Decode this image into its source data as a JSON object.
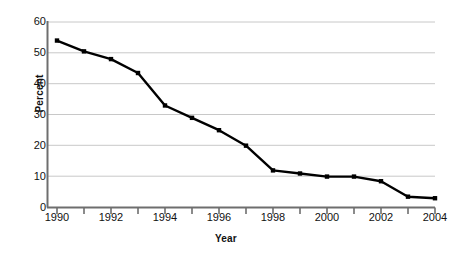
{
  "chart_data": {
    "type": "line",
    "title": "",
    "xlabel": "Year",
    "ylabel": "Percent",
    "xlim": [
      1990,
      2004
    ],
    "ylim": [
      0,
      60
    ],
    "grid": true,
    "legend": null,
    "ytick_labels": [
      "60",
      "50",
      "40",
      "30",
      "20",
      "10",
      "0"
    ],
    "yticks": [
      60,
      50,
      40,
      30,
      20,
      10,
      0
    ],
    "xtick_labels": [
      "1990",
      "1992",
      "1994",
      "1996",
      "1998",
      "2000",
      "2002",
      "2004"
    ],
    "xticks": [
      1990,
      1992,
      1994,
      1996,
      1998,
      2000,
      2002,
      2004
    ],
    "minor_xticks": [
      1991,
      1993,
      1995,
      1997,
      1999,
      2001,
      2003
    ],
    "x": [
      1990,
      1991,
      1992,
      1993,
      1994,
      1995,
      1996,
      1997,
      1998,
      1999,
      2000,
      2001,
      2002,
      2003,
      2004
    ],
    "values": [
      54,
      50.5,
      48,
      43.5,
      33,
      29,
      25,
      20,
      12,
      11,
      10,
      10,
      8.5,
      3.5,
      3
    ],
    "series": [
      {
        "name": "Percent",
        "values": [
          54,
          50.5,
          48,
          43.5,
          33,
          29,
          25,
          20,
          12,
          11,
          10,
          10,
          8.5,
          3.5,
          3
        ]
      }
    ],
    "line_color": "#000000",
    "marker": "square",
    "grid_color": "#c8c8c8",
    "axis_color": "#6e6e6e"
  }
}
